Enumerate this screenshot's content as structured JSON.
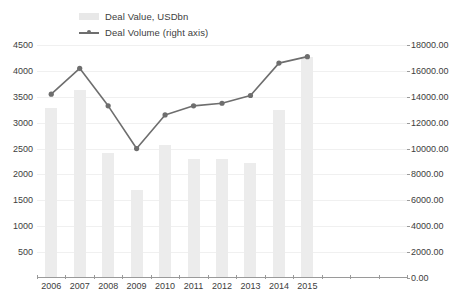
{
  "legend": {
    "items": [
      {
        "label": "Deal Value, USDbn",
        "type": "bar-swatch",
        "color": "#ececec"
      },
      {
        "label": "Deal Volume (right axis)",
        "type": "line-swatch",
        "color": "#6e6e6e"
      }
    ]
  },
  "axes": {
    "left": {
      "ticks": [
        "4500",
        "4000",
        "3500",
        "3000",
        "2500",
        "2000",
        "1500",
        "1000",
        "500"
      ],
      "min": 0,
      "max": 4500
    },
    "right": {
      "ticks": [
        "18000.00",
        "16000.00",
        "14000.00",
        "12000.00",
        "10000.00",
        "8000.00",
        "6000.00",
        "4000.00",
        "2000.00",
        "0.00"
      ],
      "min": 0,
      "max": 18000
    }
  },
  "chart_data": {
    "type": "bar",
    "title": "",
    "subtitle": "",
    "xlabel": "",
    "ylabel": "",
    "grid": true,
    "legend_position": "top-left",
    "categories": [
      "2006",
      "2007",
      "2008",
      "2009",
      "2010",
      "2011",
      "2012",
      "2013",
      "2014",
      "2015"
    ],
    "series": [
      {
        "name": "Deal Value, USDbn",
        "type": "bar",
        "axis": "left",
        "color": "#ececec",
        "values": [
          3270,
          3610,
          2400,
          1690,
          2550,
          2280,
          2270,
          2200,
          3230,
          4250
        ]
      },
      {
        "name": "Deal Volume (right axis)",
        "type": "line",
        "axis": "right",
        "color": "#6e6e6e",
        "values": [
          14200,
          16200,
          13300,
          10000,
          12600,
          13300,
          13500,
          14100,
          16600,
          17100
        ]
      }
    ],
    "ylim": [
      0,
      4500
    ],
    "ylim_right": [
      0,
      18000
    ]
  }
}
